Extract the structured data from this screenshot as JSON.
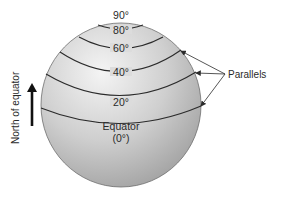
{
  "diagram": {
    "side_label": "North of equator",
    "callout_label": "Parallels",
    "latitudes": [
      {
        "label": "90°"
      },
      {
        "label": "80°"
      },
      {
        "label": "60°"
      },
      {
        "label": "40°"
      },
      {
        "label": "20°"
      },
      {
        "label": "Equator"
      },
      {
        "label": "(0°)"
      }
    ],
    "colors": {
      "sphere_light": "#f2f2f2",
      "sphere_mid": "#c9c9c9",
      "sphere_dark": "#9a9a9a",
      "line": "#2b2b2b"
    }
  }
}
